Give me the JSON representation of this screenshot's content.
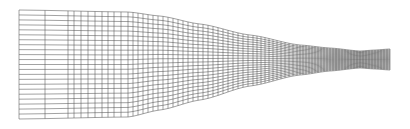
{
  "figure": {
    "description": "Structured computational mesh of a converging channel / nozzle",
    "canvas": {
      "width": 410,
      "height": 129,
      "background": "#ffffff"
    },
    "line_color": "#555555",
    "line_width": 0.55
  },
  "mesh": {
    "rows": 22,
    "top_boundary": [
      [
        19,
        10
      ],
      [
        128,
        12
      ],
      [
        160,
        16
      ],
      [
        200,
        24
      ],
      [
        250,
        35
      ],
      [
        300,
        45
      ],
      [
        330,
        48
      ],
      [
        360,
        51
      ],
      [
        375,
        50
      ],
      [
        390,
        49
      ]
    ],
    "bottom_boundary": [
      [
        19,
        119
      ],
      [
        128,
        117
      ],
      [
        160,
        110
      ],
      [
        200,
        100
      ],
      [
        250,
        86
      ],
      [
        300,
        75
      ],
      [
        330,
        71
      ],
      [
        360,
        68
      ],
      [
        375,
        69
      ],
      [
        390,
        70
      ]
    ],
    "columns_x": [
      19,
      45,
      68,
      74,
      81,
      88,
      95,
      102,
      108,
      114,
      121,
      128,
      133,
      138,
      143,
      148,
      153,
      158,
      163,
      168,
      173,
      178,
      183,
      188,
      193,
      198,
      203,
      208,
      213,
      218,
      223,
      228,
      233,
      238,
      243,
      248,
      253,
      257,
      261,
      265,
      269,
      273,
      277,
      281,
      285,
      289,
      293,
      297,
      300,
      303,
      306,
      309,
      312,
      315,
      318,
      321,
      324,
      327,
      330,
      333,
      336,
      339,
      342,
      345,
      348,
      351,
      354,
      357,
      360,
      363,
      366,
      369,
      372,
      375,
      378,
      381,
      384,
      387,
      390
    ]
  }
}
